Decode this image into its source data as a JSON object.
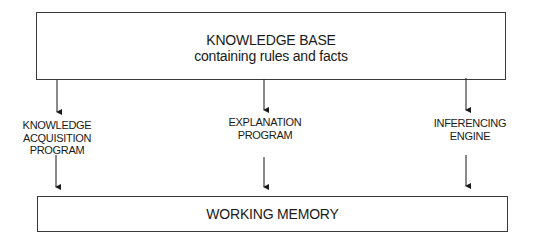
{
  "diagram": {
    "knowledge_base": {
      "title": "KNOWLEDGE BASE",
      "subtitle": "containing rules and facts"
    },
    "components": [
      {
        "label_lines": [
          "KNOWLEDGE",
          "ACQUISITION",
          "PROGRAM"
        ]
      },
      {
        "label_lines": [
          "EXPLANATION",
          "PROGRAM"
        ]
      },
      {
        "label_lines": [
          "INFERENCING",
          "ENGINE"
        ]
      }
    ],
    "working_memory": {
      "title": "WORKING MEMORY"
    },
    "edges": [
      {
        "from": "KNOWLEDGE BASE",
        "to": "KNOWLEDGE ACQUISITION PROGRAM"
      },
      {
        "from": "KNOWLEDGE BASE",
        "to": "EXPLANATION PROGRAM"
      },
      {
        "from": "KNOWLEDGE BASE",
        "to": "INFERENCING ENGINE"
      },
      {
        "from": "KNOWLEDGE ACQUISITION PROGRAM",
        "to": "WORKING MEMORY"
      },
      {
        "from": "EXPLANATION PROGRAM",
        "to": "WORKING MEMORY"
      },
      {
        "from": "INFERENCING ENGINE",
        "to": "WORKING MEMORY"
      }
    ],
    "colors": {
      "stroke": "#3a3a3a",
      "text": "#1a1a1a",
      "background": "#ffffff"
    }
  }
}
